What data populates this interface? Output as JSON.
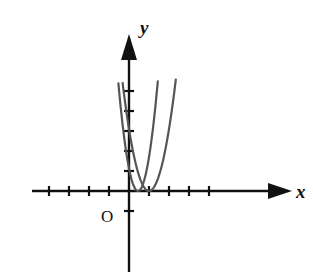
{
  "figure": {
    "background_color": "#ffffff",
    "axis_color": "#111111",
    "curve_color": "#555555"
  },
  "axes": {
    "x": {
      "label": "x",
      "arrow": true,
      "origin_px": 129,
      "y_px": 191,
      "start_px": 32,
      "end_px": 286,
      "tick_spacing_px": 20,
      "ticks_negative": 4,
      "ticks_positive": 4,
      "tick_half_len": 5
    },
    "y": {
      "label": "y",
      "arrow": true,
      "origin_px": 191,
      "x_px": 129,
      "top_px": 34,
      "bottom_px": 272,
      "tick_spacing_px": 20,
      "ticks_positive": 5,
      "ticks_negative": 1,
      "tick_half_len": 5
    },
    "origin": {
      "label": "O",
      "x_px": 108,
      "y_px": 216
    }
  },
  "chart_data": {
    "type": "line",
    "title": "",
    "xlabel": "x",
    "ylabel": "y",
    "grid": false,
    "legend": "none",
    "xlim": [
      -4.85,
      7.85
    ],
    "ylim": [
      -4.05,
      7.85
    ],
    "tick_values_x": [
      -4,
      -3,
      -2,
      -1,
      1,
      2,
      3,
      4
    ],
    "tick_values_y": [
      -1,
      1,
      2,
      3,
      4,
      5
    ],
    "series": [
      {
        "name": "curve-1",
        "equation": "y = a(x - 0.45)^2",
        "vertex": [
          0.45,
          0
        ],
        "leading_coefficient": 5.6,
        "stroke": "#555555",
        "stroke_width": 2.2,
        "x_range": [
          -0.53,
          1.44
        ]
      },
      {
        "name": "curve-2",
        "equation": "y = b(x - 1.0)^2",
        "vertex": [
          1.0,
          0
        ],
        "leading_coefficient": 3.1,
        "stroke": "#555555",
        "stroke_width": 2.2,
        "x_range": [
          -0.32,
          2.34
        ]
      }
    ]
  }
}
